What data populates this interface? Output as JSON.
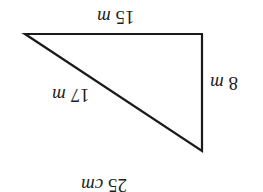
{
  "diagram": {
    "type": "right-triangle",
    "orientation": "rotated-180",
    "stroke_color": "#1a1a1a",
    "labels": {
      "top_side": {
        "value": "15",
        "unit": "m"
      },
      "right_side": {
        "value": "8",
        "unit": "m"
      },
      "hypotenuse": {
        "value": "17",
        "unit": "m"
      },
      "bottom_caption": {
        "value": "25",
        "unit": "cm"
      }
    }
  }
}
